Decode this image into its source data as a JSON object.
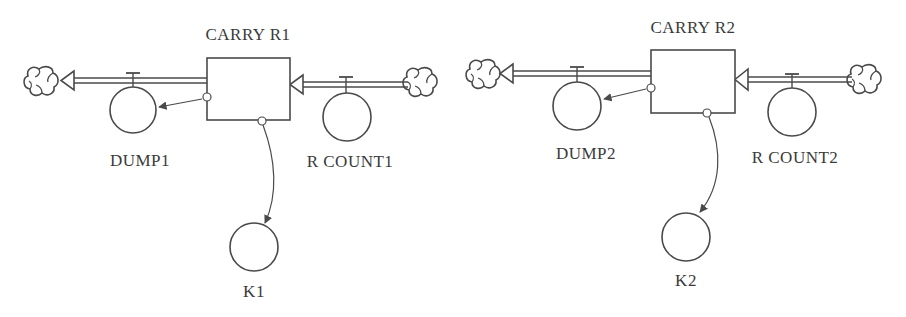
{
  "diagram": {
    "type": "stock-and-flow",
    "colors": {
      "line": "#4a4a4a",
      "text": "#3a3a3a",
      "background": "#ffffff"
    },
    "models": [
      {
        "stock": {
          "label": "CARRY R1"
        },
        "outflow": {
          "label": "DUMP1",
          "source_icon": "cloud-sink-icon"
        },
        "inflow": {
          "label": "R COUNT1",
          "source_icon": "cloud-source-icon"
        },
        "auxiliary": {
          "label": "K1"
        }
      },
      {
        "stock": {
          "label": "CARRY R2"
        },
        "outflow": {
          "label": "DUMP2",
          "source_icon": "cloud-sink-icon"
        },
        "inflow": {
          "label": "R COUNT2",
          "source_icon": "cloud-source-icon"
        },
        "auxiliary": {
          "label": "K2"
        }
      }
    ]
  }
}
